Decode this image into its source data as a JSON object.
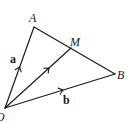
{
  "diagram": {
    "type": "vector-triangle",
    "points": {
      "O": {
        "label": "O",
        "x": 5,
        "y": 108
      },
      "A": {
        "label": "A",
        "x": 34,
        "y": 27
      },
      "M": {
        "label": "M",
        "x": 71,
        "y": 48
      },
      "B": {
        "label": "B",
        "x": 115,
        "y": 74
      }
    },
    "vectors": [
      {
        "from": "O",
        "to": "A",
        "label": "a",
        "style": "bold"
      },
      {
        "from": "O",
        "to": "B",
        "label": "b",
        "style": "bold"
      },
      {
        "from": "O",
        "to": "M",
        "label": "",
        "style": "none"
      }
    ],
    "segments": [
      {
        "from": "A",
        "to": "B"
      }
    ],
    "colors": {
      "stroke": "#1a1a1a",
      "background": "#ffffff"
    }
  }
}
